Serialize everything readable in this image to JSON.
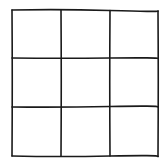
{
  "grid": {
    "rows": 3,
    "cols": 3,
    "line_color": "#1a1a1a",
    "background": "#ffffff",
    "cells": [
      "",
      "",
      "",
      "",
      "",
      "",
      "",
      "",
      ""
    ]
  }
}
